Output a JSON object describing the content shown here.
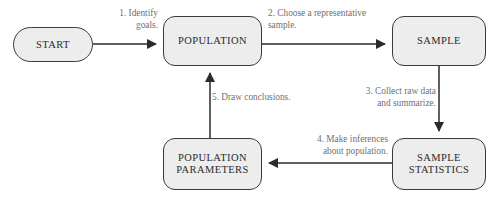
{
  "diagram": {
    "colors": {
      "node_fill": "#ededed",
      "node_stroke": "#3a3a3a",
      "node_text": "#2b2b2b",
      "edge_line": "#2b2b2b",
      "edge_label_text": "#6f6f6f",
      "background": "#ffffff"
    },
    "nodes": [
      {
        "id": "start",
        "label": "START",
        "shape": "stadium"
      },
      {
        "id": "population",
        "label": "POPULATION",
        "shape": "rounded-rect"
      },
      {
        "id": "sample",
        "label": "SAMPLE",
        "shape": "rounded-rect"
      },
      {
        "id": "population_parameters",
        "label": "POPULATION\nPARAMETERS",
        "shape": "rounded-rect"
      },
      {
        "id": "sample_statistics",
        "label": "SAMPLE\nSTATISTICS",
        "shape": "rounded-rect"
      }
    ],
    "edges": [
      {
        "id": "e1",
        "from": "start",
        "to": "population",
        "label": "1. Identify\ngoals.",
        "direction": "right"
      },
      {
        "id": "e2",
        "from": "population",
        "to": "sample",
        "label": "2. Choose a representative\nsample.",
        "direction": "right"
      },
      {
        "id": "e3",
        "from": "sample",
        "to": "sample_statistics",
        "label": "3. Collect raw data\nand summarize.",
        "direction": "down"
      },
      {
        "id": "e4",
        "from": "sample_statistics",
        "to": "population_parameters",
        "label": "4. Make inferences\nabout population.",
        "direction": "left"
      },
      {
        "id": "e5",
        "from": "population_parameters",
        "to": "population",
        "label": "5. Draw conclusions.",
        "direction": "up"
      }
    ]
  }
}
